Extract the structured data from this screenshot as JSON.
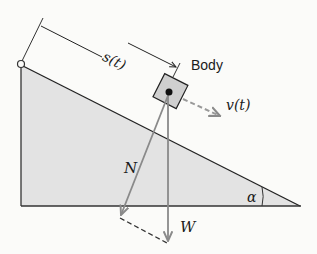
{
  "diagram": {
    "labels": {
      "displacement": "s(t)",
      "body": "Body",
      "velocity": "v(t)",
      "normal_force": "N",
      "weight": "W",
      "angle": "α"
    },
    "colors": {
      "incline_fill": "#e3e3e3",
      "outline": "#222222",
      "body_fill": "#cfcfcf",
      "force_arrow": "#8a8a8a",
      "velocity_arrow": "#999999",
      "background": "#fbfbf9"
    },
    "geometry": {
      "incline_top": [
        21,
        65
      ],
      "incline_bottom_left": [
        21,
        206
      ],
      "incline_tip": [
        300,
        206
      ],
      "body_center": [
        170,
        92
      ],
      "normal_end": [
        120,
        217
      ],
      "weight_end": [
        168,
        243
      ]
    }
  }
}
